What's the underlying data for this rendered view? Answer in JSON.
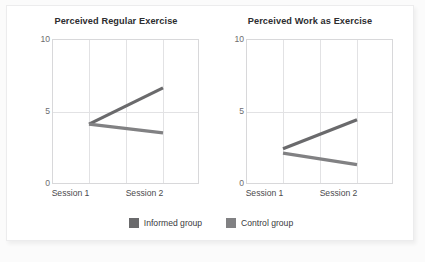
{
  "figure": {
    "background_color": "#ffffff",
    "card_color": "#ffffff",
    "grid_color": "#e2e2e4",
    "frame_color": "#d8d8da"
  },
  "legend": {
    "position": "bottom-center",
    "entries": [
      {
        "label": "Informed group",
        "color": "#6a6a6c",
        "swatch_name": "legend-swatch-informed"
      },
      {
        "label": "Control group",
        "color": "#818183",
        "swatch_name": "legend-swatch-control"
      }
    ]
  },
  "chart_data": [
    {
      "type": "line",
      "title": "Perceived Regular Exercise",
      "xlabel": "",
      "ylabel": "",
      "categories": [
        "Session 1",
        "Session 2"
      ],
      "x": [
        1,
        2
      ],
      "ylim": [
        0,
        10
      ],
      "yticks": [
        0,
        5,
        10
      ],
      "ytick_labels": [
        "0",
        "5",
        "10"
      ],
      "grid": true,
      "series": [
        {
          "name": "Informed group",
          "values": [
            4.2,
            6.7
          ],
          "color": "#6a6a6c"
        },
        {
          "name": "Control group",
          "values": [
            4.2,
            3.6
          ],
          "color": "#818183"
        }
      ]
    },
    {
      "type": "line",
      "title": "Perceived Work as Exercise",
      "xlabel": "",
      "ylabel": "",
      "categories": [
        "Session 1",
        "Session 2"
      ],
      "x": [
        1,
        2
      ],
      "ylim": [
        0,
        10
      ],
      "yticks": [
        0,
        5,
        10
      ],
      "ytick_labels": [
        "0",
        "5",
        "10"
      ],
      "grid": true,
      "series": [
        {
          "name": "Informed group",
          "values": [
            2.5,
            4.5
          ],
          "color": "#6a6a6c"
        },
        {
          "name": "Control group",
          "values": [
            2.2,
            1.4
          ],
          "color": "#818183"
        }
      ]
    }
  ]
}
